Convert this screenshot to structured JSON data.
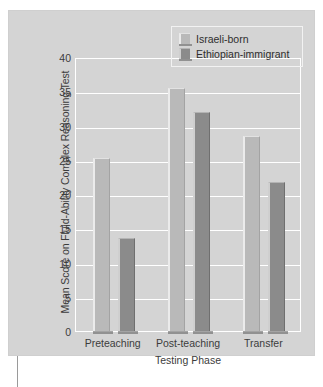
{
  "chart_data": {
    "type": "bar",
    "title": "",
    "xlabel": "Testing Phase",
    "ylabel": "Mean Score on Fluid-Ability Complex Reasoning Test",
    "categories": [
      "Preteaching",
      "Post-teaching",
      "Transfer"
    ],
    "series": [
      {
        "name": "Israeli-born",
        "color": "#b9b9b9",
        "values": [
          25.3,
          35.5,
          28.5
        ]
      },
      {
        "name": "Ethiopian-immigrant",
        "color": "#8b8b8b",
        "values": [
          13.6,
          32.0,
          21.8
        ]
      }
    ],
    "ylim": [
      0,
      40
    ],
    "yticks": [
      0,
      5,
      10,
      15,
      20,
      25,
      30,
      35,
      40
    ],
    "ytick_labels": [
      "0",
      "5",
      "10",
      "15",
      "20",
      "25",
      "30",
      "35",
      "40"
    ],
    "grid": true,
    "grid_color": "#ffffff",
    "legend_position": "top-right",
    "plot_background": "#d4d4d4"
  },
  "legend": {
    "entries": [
      {
        "label": "Israeli-born"
      },
      {
        "label": "Ethiopian-immigrant"
      }
    ]
  }
}
